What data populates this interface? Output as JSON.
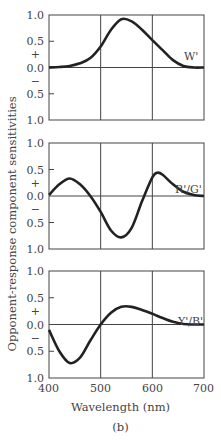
{
  "figure": {
    "ylabel": "Opponent-response component sensitivities",
    "xlabel": "Wavelength (nm)",
    "caption": "(b)",
    "ytick_labels": [
      "1.0",
      "0.5",
      "+",
      "0.0",
      "−",
      "0.5",
      "1.0"
    ],
    "xtick_labels": [
      "400",
      "500",
      "600",
      "700"
    ]
  },
  "chart_data": [
    {
      "type": "line",
      "title": "W'",
      "xlabel": "Wavelength (nm)",
      "ylabel": "Opponent-response component sensitivities",
      "xlim": [
        400,
        700
      ],
      "ylim": [
        -1.0,
        1.0
      ],
      "grid": "vertical at 500, 600",
      "x": [
        400,
        420,
        440,
        460,
        480,
        500,
        520,
        540,
        560,
        580,
        600,
        620,
        640,
        660,
        680,
        700
      ],
      "values": [
        0.0,
        0.01,
        0.03,
        0.08,
        0.18,
        0.4,
        0.72,
        0.92,
        0.88,
        0.72,
        0.52,
        0.33,
        0.14,
        0.03,
        0.0,
        0.0
      ]
    },
    {
      "type": "line",
      "title": "R'/G'",
      "xlabel": "Wavelength (nm)",
      "ylim": [
        -1.0,
        1.0
      ],
      "xlim": [
        400,
        700
      ],
      "x": [
        400,
        420,
        440,
        460,
        480,
        500,
        520,
        540,
        560,
        580,
        600,
        610,
        620,
        640,
        660,
        680,
        700
      ],
      "values": [
        0.02,
        0.22,
        0.33,
        0.22,
        0.0,
        -0.3,
        -0.65,
        -0.78,
        -0.6,
        -0.1,
        0.35,
        0.44,
        0.4,
        0.22,
        0.08,
        0.02,
        0.0
      ]
    },
    {
      "type": "line",
      "title": "Y'/B'",
      "xlabel": "Wavelength (nm)",
      "ylim": [
        -1.0,
        1.0
      ],
      "xlim": [
        400,
        700
      ],
      "x": [
        400,
        420,
        440,
        460,
        480,
        500,
        520,
        540,
        560,
        580,
        600,
        620,
        640,
        660,
        680,
        700
      ],
      "values": [
        -0.1,
        -0.5,
        -0.72,
        -0.62,
        -0.3,
        0.0,
        0.22,
        0.33,
        0.33,
        0.27,
        0.2,
        0.12,
        0.05,
        0.01,
        0.0,
        0.0
      ]
    }
  ]
}
